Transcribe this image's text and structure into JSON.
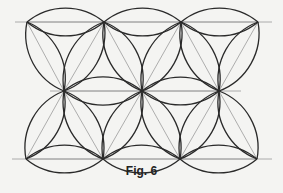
{
  "figure": {
    "caption": "Fig. 6",
    "colors": {
      "arc": "#2a2a2a",
      "guide": "#9a9a9a",
      "background": "#f4f4f2"
    },
    "vertices": {
      "top": [
        [
          27,
          22
        ],
        [
          104,
          22
        ],
        [
          181,
          22
        ],
        [
          258,
          22
        ]
      ],
      "middle": [
        [
          64,
          91
        ],
        [
          142,
          91
        ],
        [
          219,
          91
        ]
      ],
      "bottom": [
        [
          26,
          159
        ],
        [
          103,
          159
        ],
        [
          180,
          159
        ],
        [
          257,
          159
        ]
      ]
    },
    "guide_lines": [
      {
        "x1": 15,
        "y1": 22,
        "x2": 272,
        "y2": 22
      },
      {
        "x1": 50,
        "y1": 91,
        "x2": 241,
        "y2": 91
      },
      {
        "x1": 12,
        "y1": 159,
        "x2": 272,
        "y2": 159
      }
    ]
  }
}
